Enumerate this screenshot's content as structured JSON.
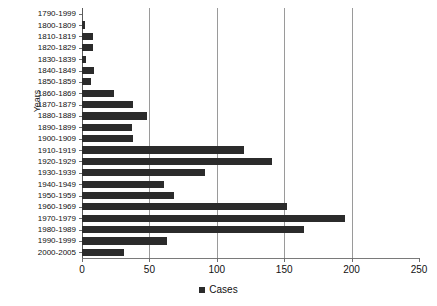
{
  "chart_data": {
    "type": "bar",
    "orientation": "horizontal",
    "title": "",
    "xlabel": "",
    "ylabel": "Years",
    "xlim": [
      0,
      250
    ],
    "ylim": null,
    "grid": true,
    "legend_position": "bottom",
    "legend": [
      "Cases"
    ],
    "xticks": [
      0,
      50,
      100,
      150,
      200,
      250
    ],
    "categories": [
      "1790-1999",
      "1800-1809",
      "1810-1819",
      "1820-1829",
      "1830-1839",
      "1840-1849",
      "1850-1859",
      "1860-1869",
      "1870-1879",
      "1880-1889",
      "1890-1899",
      "1900-1909",
      "1910-1919",
      "1920-1929",
      "1930-1939",
      "1940-1949",
      "1950-1959",
      "1960-1969",
      "1970-1979",
      "1980-1989",
      "1990-1999",
      "2000-2005"
    ],
    "series": [
      {
        "name": "Cases",
        "color": "#2b2b2b",
        "values": [
          0,
          2,
          8,
          8,
          3,
          9,
          7,
          24,
          38,
          48,
          37,
          38,
          120,
          141,
          91,
          61,
          68,
          152,
          195,
          165,
          63,
          31
        ]
      }
    ]
  }
}
